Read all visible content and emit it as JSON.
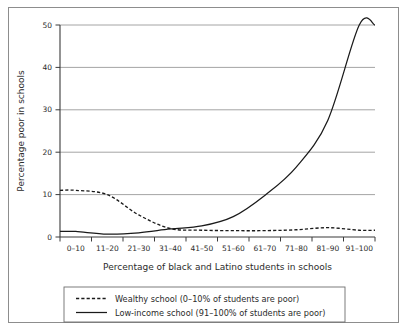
{
  "chart_data": {
    "type": "line",
    "title": "",
    "xlabel": "Percentage of black and Latino students in schools",
    "ylabel": "Percentage poor in schools",
    "categories": [
      "0–10",
      "11–20",
      "21–30",
      "31–40",
      "41–50",
      "51–60",
      "61–70",
      "71–80",
      "81–90",
      "91–100"
    ],
    "ylim": [
      0,
      50
    ],
    "yticks": [
      0,
      10,
      20,
      30,
      40,
      50
    ],
    "ytick_labels": [
      "0",
      "10",
      "20",
      "30",
      "40",
      "50"
    ],
    "grid": "horizontal",
    "legend_position": "below",
    "series": [
      {
        "name": "Wealthy school (0–10% of students are poor)",
        "style": "dashed",
        "color": "#1a1a1a",
        "values": [
          11.0,
          10.0,
          5.2,
          2.0,
          1.6,
          1.5,
          1.5,
          1.7,
          2.2,
          1.6
        ]
      },
      {
        "name": "Low-income school (91–100% of students are poor)",
        "style": "solid",
        "color": "#1a1a1a",
        "values": [
          1.3,
          0.7,
          1.0,
          1.9,
          2.6,
          4.8,
          9.8,
          16.5,
          27.5,
          50.0
        ]
      }
    ]
  },
  "axes": {
    "y_label": "Percentage poor in schools",
    "x_label": "Percentage of black and Latino students in schools",
    "y_tick_0": "0",
    "y_tick_10": "10",
    "y_tick_20": "20",
    "y_tick_30": "30",
    "y_tick_40": "40",
    "y_tick_50": "50",
    "x_tick_0": "0–10",
    "x_tick_1": "11–20",
    "x_tick_2": "21–30",
    "x_tick_3": "31–40",
    "x_tick_4": "41–50",
    "x_tick_5": "51–60",
    "x_tick_6": "61–70",
    "x_tick_7": "71–80",
    "x_tick_8": "81–90",
    "x_tick_9": "91–100"
  },
  "legend": {
    "item_1": "Wealthy school (0–10% of students are poor)",
    "item_2": "Low-income school (91–100% of students are poor)"
  },
  "colors": {
    "line": "#1a1a1a",
    "grid": "#9a9a9a",
    "axis": "#4a4a4a",
    "frame": "#8d8d8d",
    "background": "#ffffff"
  }
}
